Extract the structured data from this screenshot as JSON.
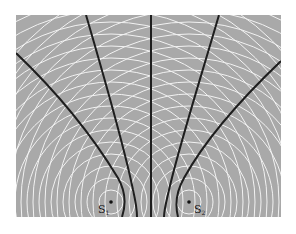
{
  "diagram": {
    "type": "two-source interference pattern",
    "background_color": "#a9a9a9",
    "wavefront_color": "#f2f2f2",
    "nodal_line_color": "#1e1e1e",
    "frame": {
      "x": 16,
      "y": 15,
      "width": 265,
      "height": 202
    },
    "sources": [
      {
        "id": "S1",
        "label": "S",
        "subscript": "1",
        "x": 111,
        "y": 202
      },
      {
        "id": "S2",
        "label": "S",
        "subscript": "2",
        "x": 189,
        "y": 202
      }
    ],
    "wavefront_radii": [
      12,
      24,
      36,
      48,
      60,
      72,
      84,
      96,
      108,
      120,
      132,
      144,
      156,
      168,
      180,
      192,
      204,
      216,
      228
    ],
    "nodal_lines": [
      {
        "name": "outer-left",
        "path": "M16,53 C60,95 95,140 118,178 C126,192 126,205 122,217"
      },
      {
        "name": "inner-left",
        "path": "M86,15 C105,80 125,150 133,190 C136,203 137,210 137,217"
      },
      {
        "name": "center",
        "path": "M151,15 L151,217"
      },
      {
        "name": "inner-right",
        "path": "M219,15 C200,80 178,150 169,190 C166,203 164,210 164,217"
      },
      {
        "name": "outer-right",
        "path": "M281,61 C240,100 205,140 184,178 C176,192 175,205 178,217"
      }
    ]
  }
}
